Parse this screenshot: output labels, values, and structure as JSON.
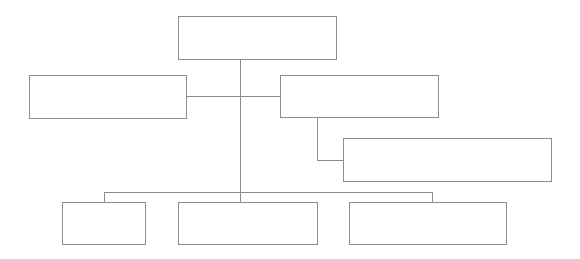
{
  "diagram": {
    "type": "org-chart",
    "line_color": "#8c8c8c",
    "nodes": [
      {
        "id": "root",
        "label": ""
      },
      {
        "id": "left-assistant",
        "label": ""
      },
      {
        "id": "right-assistant",
        "label": ""
      },
      {
        "id": "right-assistant-child",
        "label": ""
      },
      {
        "id": "sub-1",
        "label": ""
      },
      {
        "id": "sub-2",
        "label": ""
      },
      {
        "id": "sub-3",
        "label": ""
      }
    ]
  }
}
